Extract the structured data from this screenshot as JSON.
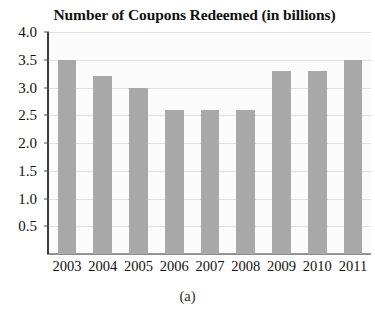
{
  "chart_data": {
    "type": "bar",
    "title": "Number of Coupons Redeemed (in billions)",
    "xlabel": "",
    "ylabel": "",
    "categories": [
      "2003",
      "2004",
      "2005",
      "2006",
      "2007",
      "2008",
      "2009",
      "2010",
      "2011"
    ],
    "values": [
      3.5,
      3.2,
      3.0,
      2.6,
      2.6,
      2.6,
      3.3,
      3.3,
      3.5
    ],
    "ylim": [
      0,
      4.0
    ],
    "ytick_labels": [
      "4.0",
      "3.5",
      "3.0",
      "2.5",
      "2.0",
      "1.5",
      "1.0",
      "0.5"
    ],
    "ytick_values": [
      4.0,
      3.5,
      3.0,
      2.5,
      2.0,
      1.5,
      1.0,
      0.5
    ],
    "ytick_step": 0.5,
    "grid": true,
    "grid_axis": "y",
    "legend": false,
    "legend_position": "none",
    "bar_color": "#a8a8a8",
    "gridline_color": "#e2e2e2",
    "axis_color": "#3b3b3b",
    "plot_background": "#fbfbfb"
  },
  "caption": {
    "label": "(a)"
  }
}
